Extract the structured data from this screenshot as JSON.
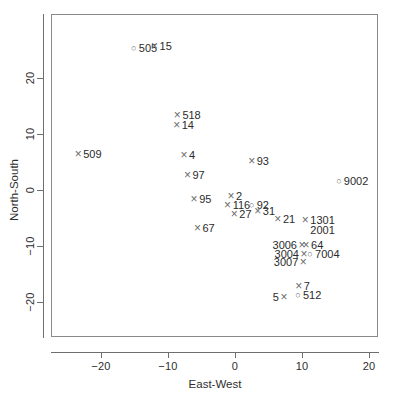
{
  "chart_data": {
    "type": "scatter",
    "title": "",
    "xlabel": "East-West",
    "ylabel": "North-South",
    "xlim": [
      -27.5,
      21.5
    ],
    "ylim": [
      -24.5,
      26.5
    ],
    "xticks": [
      -20,
      -10,
      0,
      10,
      20
    ],
    "yticks": [
      -20,
      -10,
      0,
      10,
      20
    ],
    "grid": false,
    "legend": null,
    "marker_glyphs": {
      "cross": "×",
      "circle": "○"
    },
    "points": [
      {
        "label": "505",
        "marker": "circle",
        "x": -15.1,
        "y": 25.2,
        "lpos": "right"
      },
      {
        "label": "15",
        "marker": "cross",
        "x": -12.0,
        "y": 25.6,
        "lpos": "right"
      },
      {
        "label": "518",
        "marker": "cross",
        "x": -8.6,
        "y": 13.4,
        "lpos": "right"
      },
      {
        "label": "14",
        "marker": "cross",
        "x": -8.7,
        "y": 11.6,
        "lpos": "right"
      },
      {
        "label": "509",
        "marker": "cross",
        "x": -23.4,
        "y": 6.4,
        "lpos": "right"
      },
      {
        "label": "4",
        "marker": "cross",
        "x": -7.6,
        "y": 6.2,
        "lpos": "right"
      },
      {
        "label": "93",
        "marker": "cross",
        "x": 2.5,
        "y": 5.2,
        "lpos": "right"
      },
      {
        "label": "97",
        "marker": "cross",
        "x": -7.1,
        "y": 2.6,
        "lpos": "right"
      },
      {
        "label": "9002",
        "marker": "circle",
        "x": 15.5,
        "y": 1.6,
        "lpos": "right"
      },
      {
        "label": "95",
        "marker": "cross",
        "x": -6.1,
        "y": -1.6,
        "lpos": "right"
      },
      {
        "label": "2",
        "marker": "cross",
        "x": -0.6,
        "y": -1.1,
        "lpos": "right"
      },
      {
        "label": "116",
        "marker": "cross",
        "x": -1.1,
        "y": -2.6,
        "lpos": "right"
      },
      {
        "label": "92",
        "marker": "circle",
        "x": 2.5,
        "y": -2.6,
        "lpos": "right"
      },
      {
        "label": "27",
        "marker": "cross",
        "x": -0.1,
        "y": -4.2,
        "lpos": "right"
      },
      {
        "label": "31",
        "marker": "cross",
        "x": 3.4,
        "y": -3.8,
        "lpos": "right"
      },
      {
        "label": "21",
        "marker": "cross",
        "x": 6.4,
        "y": -5.2,
        "lpos": "right"
      },
      {
        "label": "67",
        "marker": "cross",
        "x": -5.6,
        "y": -6.8,
        "lpos": "right"
      },
      {
        "label": "1301",
        "marker": "cross",
        "x": 10.5,
        "y": -5.4,
        "lpos": "right"
      },
      {
        "label": "2001",
        "marker": "none",
        "x": 10.5,
        "y": -7.2,
        "lpos": "right"
      },
      {
        "label": "3006",
        "marker": "cross",
        "x": 10.0,
        "y": -9.8,
        "lpos": "left"
      },
      {
        "label": "64",
        "marker": "cross",
        "x": 10.6,
        "y": -9.8,
        "lpos": "right"
      },
      {
        "label": "3004",
        "marker": "cross",
        "x": 10.3,
        "y": -11.4,
        "lpos": "left"
      },
      {
        "label": "7004",
        "marker": "circle",
        "x": 11.2,
        "y": -11.4,
        "lpos": "right"
      },
      {
        "label": "3007",
        "marker": "cross",
        "x": 10.2,
        "y": -12.8,
        "lpos": "left"
      },
      {
        "label": "7",
        "marker": "cross",
        "x": 9.5,
        "y": -17.0,
        "lpos": "right"
      },
      {
        "label": "512",
        "marker": "circle",
        "x": 9.4,
        "y": -18.6,
        "lpos": "right"
      },
      {
        "label": "5",
        "marker": "cross",
        "x": 7.3,
        "y": -19.0,
        "lpos": "left"
      }
    ]
  }
}
